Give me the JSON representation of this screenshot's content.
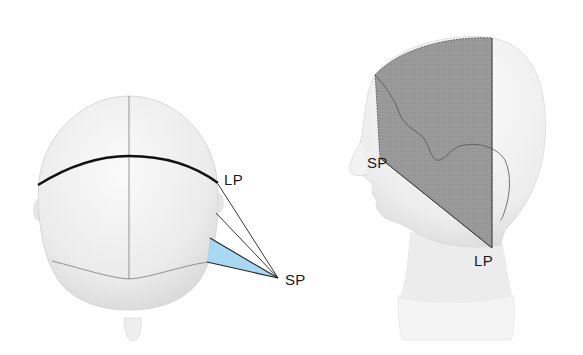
{
  "figure": {
    "left_view": {
      "name": "top-view-head",
      "labels": {
        "lp": "LP",
        "sp": "SP"
      },
      "highlight_color": "#a9d8f2"
    },
    "right_view": {
      "name": "side-view-head",
      "labels": {
        "sp": "SP",
        "lp": "LP"
      },
      "shaded_region_color": "#9b9b9b"
    }
  }
}
